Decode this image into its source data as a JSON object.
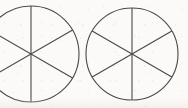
{
  "figure": {
    "background_color": "#fbfaf8",
    "stroke_color": "#4a4845",
    "stroke_width": 1.1,
    "canvas": {
      "width": 188,
      "height": 108
    },
    "shape_count": 2,
    "sectors_per_shape": 6,
    "sector_fraction_label": "1/6",
    "sector_angle_degrees": 60,
    "shapes": [
      {
        "name": "left-circle",
        "label": "Circle 1",
        "center_x": 31,
        "center_y": 54,
        "radius": 48,
        "clipped_at_left_edge": true,
        "fill": "none",
        "divider_angles_degrees": [
          90,
          30,
          150
        ],
        "divider_count": 3,
        "sectors": 6,
        "shaded_sectors": 0
      },
      {
        "name": "right-circle",
        "label": "Circle 2",
        "center_x": 132,
        "center_y": 54,
        "radius": 46,
        "clipped_at_left_edge": false,
        "fill": "none",
        "divider_angles_degrees": [
          90,
          30,
          150
        ],
        "divider_count": 3,
        "sectors": 6,
        "shaded_sectors": 0
      }
    ]
  }
}
